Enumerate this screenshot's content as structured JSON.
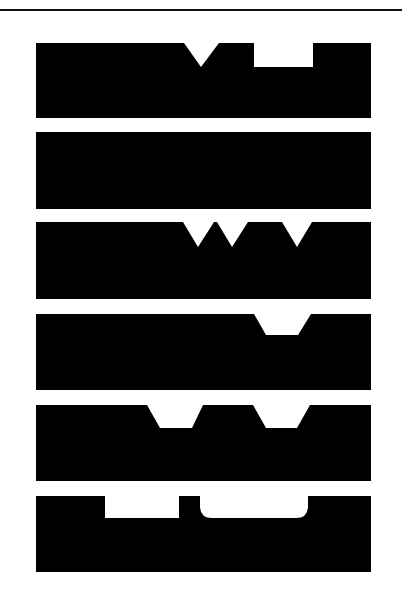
{
  "figure": {
    "colors": {
      "bar": "#000000",
      "background": "#ffffff",
      "rule": "#111111"
    },
    "bars": [
      {
        "id": 1,
        "notches": [
          "v-notch",
          "rectangular-notch"
        ]
      },
      {
        "id": 2,
        "notches": []
      },
      {
        "id": 3,
        "notches": [
          "v-notch",
          "v-notch",
          "v-notch"
        ]
      },
      {
        "id": 4,
        "notches": [
          "trapezoid-notch"
        ]
      },
      {
        "id": 5,
        "notches": [
          "trapezoid-notch",
          "trapezoid-notch"
        ]
      },
      {
        "id": 6,
        "notches": [
          "rectangular-notch",
          "rounded-notch"
        ]
      }
    ]
  }
}
